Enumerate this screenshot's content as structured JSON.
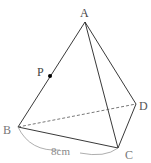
{
  "diagram": {
    "type": "pyramid",
    "vertices": {
      "A": {
        "label": "A",
        "x": 85,
        "y": 22
      },
      "B": {
        "label": "B",
        "x": 18,
        "y": 127
      },
      "C": {
        "label": "C",
        "x": 118,
        "y": 148
      },
      "D": {
        "label": "D",
        "x": 136,
        "y": 104
      },
      "P": {
        "label": "P",
        "x": 50,
        "y": 76
      }
    },
    "measurement": {
      "label": "8cm",
      "between": [
        "B",
        "C"
      ]
    },
    "colors": {
      "edge": "#222222",
      "hidden_edge": "#555555",
      "label": "#444444",
      "measure": "#888888",
      "point": "#000000"
    }
  }
}
